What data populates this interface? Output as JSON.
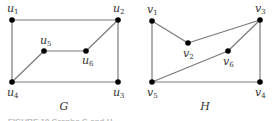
{
  "graphs": [
    {
      "name": "G",
      "nodes": [
        {
          "id": "u1",
          "base": "u",
          "sub": "1",
          "x": 12,
          "y": 20,
          "lx": 7,
          "ly": 12
        },
        {
          "id": "u2",
          "base": "u",
          "sub": "2",
          "x": 118,
          "y": 20,
          "lx": 113,
          "ly": 12
        },
        {
          "id": "u3",
          "base": "u",
          "sub": "3",
          "x": 118,
          "y": 82,
          "lx": 113,
          "ly": 96
        },
        {
          "id": "u4",
          "base": "u",
          "sub": "4",
          "x": 12,
          "y": 82,
          "lx": 7,
          "ly": 96
        },
        {
          "id": "u5",
          "base": "u",
          "sub": "5",
          "x": 44,
          "y": 51,
          "lx": 40,
          "ly": 44
        },
        {
          "id": "u6",
          "base": "u",
          "sub": "6",
          "x": 86,
          "y": 51,
          "lx": 82,
          "ly": 64
        }
      ],
      "edges": [
        [
          "u1",
          "u2"
        ],
        [
          "u1",
          "u4"
        ],
        [
          "u2",
          "u3"
        ],
        [
          "u2",
          "u6"
        ],
        [
          "u3",
          "u4"
        ],
        [
          "u4",
          "u5"
        ],
        [
          "u5",
          "u6"
        ]
      ],
      "label": "G",
      "label_pos": {
        "x": 64,
        "y": 110
      }
    },
    {
      "name": "H",
      "nodes": [
        {
          "id": "v1",
          "base": "v",
          "sub": "1",
          "x": 152,
          "y": 21,
          "lx": 147,
          "ly": 13
        },
        {
          "id": "v2",
          "base": "v",
          "sub": "2",
          "x": 188,
          "y": 43,
          "lx": 183,
          "ly": 57
        },
        {
          "id": "v3",
          "base": "v",
          "sub": "3",
          "x": 260,
          "y": 20,
          "lx": 255,
          "ly": 12
        },
        {
          "id": "v4",
          "base": "v",
          "sub": "4",
          "x": 260,
          "y": 82,
          "lx": 255,
          "ly": 96
        },
        {
          "id": "v5",
          "base": "v",
          "sub": "5",
          "x": 152,
          "y": 82,
          "lx": 147,
          "ly": 96
        },
        {
          "id": "v6",
          "base": "v",
          "sub": "6",
          "x": 228,
          "y": 51,
          "lx": 223,
          "ly": 65
        }
      ],
      "edges": [
        [
          "v1",
          "v2"
        ],
        [
          "v1",
          "v5"
        ],
        [
          "v2",
          "v3"
        ],
        [
          "v3",
          "v4"
        ],
        [
          "v3",
          "v6"
        ],
        [
          "v4",
          "v5"
        ],
        [
          "v5",
          "v6"
        ]
      ],
      "label": "H",
      "label_pos": {
        "x": 205,
        "y": 110
      }
    }
  ],
  "caption": "FIGURE 10   Graphs G and H."
}
